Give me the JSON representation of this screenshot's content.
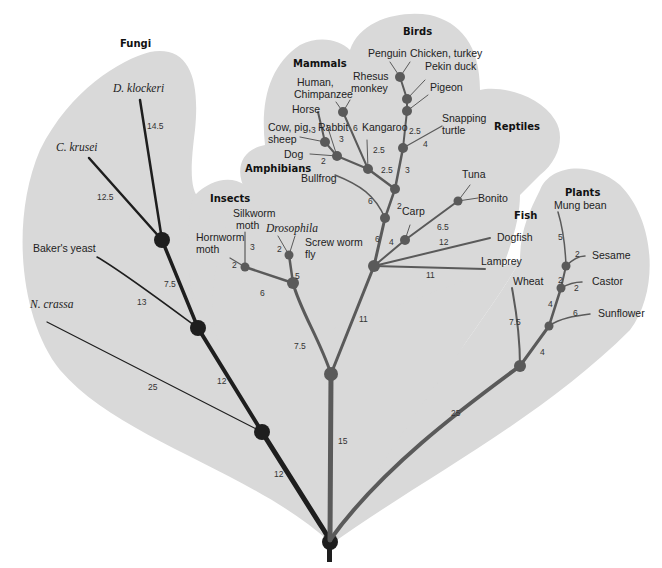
{
  "groups": [
    {
      "id": "fungi",
      "label": "Fungi"
    },
    {
      "id": "insects",
      "label": "Insects"
    },
    {
      "id": "amphibians",
      "label": "Amphibians"
    },
    {
      "id": "mammals",
      "label": "Mammals"
    },
    {
      "id": "birds",
      "label": "Birds"
    },
    {
      "id": "reptiles",
      "label": "Reptiles"
    },
    {
      "id": "fish",
      "label": "Fish"
    },
    {
      "id": "plants",
      "label": "Plants"
    }
  ],
  "species": {
    "d_klockeri": "D. klockeri",
    "c_krusei": "C. krusei",
    "bakers_yeast": "Baker's yeast",
    "n_crassa": "N. crassa",
    "hornworm_1": "Hornworm",
    "hornworm_2": "moth",
    "silkworm_1": "Silkworm",
    "silkworm_2": "moth",
    "drosophila": "Drosophila",
    "screwworm_1": "Screw worm",
    "screwworm_2": "fly",
    "human_1": "Human,",
    "human_2": "Chimpanzee",
    "rhesus_1": "Rhesus",
    "rhesus_2": "monkey",
    "horse": "Horse",
    "cow_1": "Cow, pig,",
    "cow_2": "sheep",
    "rabbit": "Rabbit",
    "kangaroo": "Kangaroo",
    "dog": "Dog",
    "bullfrog": "Bullfrog",
    "penguin": "Penguin",
    "chicken": "Chicken, turkey",
    "pekin_duck": "Pekin duck",
    "pigeon": "Pigeon",
    "snapping_1": "Snapping",
    "snapping_2": "turtle",
    "tuna": "Tuna",
    "bonito": "Bonito",
    "carp": "Carp",
    "dogfish": "Dogfish",
    "lamprey": "Lamprey",
    "wheat": "Wheat",
    "mung_bean": "Mung bean",
    "sesame": "Sesame",
    "castor": "Castor",
    "sunflower": "Sunflower"
  },
  "distances": {
    "d_klockeri": "14.5",
    "c_krusei": "12.5",
    "fungi_inner": "7.5",
    "bakers_yeast": "13",
    "n_crassa": "25",
    "fungi_stem_upper": "12",
    "fungi_stem_lower": "12",
    "hornworm": "2",
    "silkworm": "3",
    "moth_stem": "6",
    "drosophila": "2",
    "screwworm_stem": "5",
    "insect_stem": "7.5",
    "animal_upper": "11",
    "animal_trunk": "15",
    "cow": "3",
    "rabbit": "3",
    "horse_dog": "2",
    "kangaroo_a": "6",
    "kangaroo_b": "2.5",
    "placental_stem": "2.5",
    "bird_stem_a": "2.5",
    "bird_stem_b": "3",
    "snapping": "4",
    "bullfrog": "6",
    "carp_a": "2",
    "carp_b": "4",
    "vert_stem": "6",
    "tuna_stem": "6.5",
    "dogfish": "12",
    "lamprey": "11",
    "mung_bean": "5",
    "sesame": "2",
    "castor_a": "2",
    "castor_b": "2",
    "plant_mid": "4",
    "sunflower": "6",
    "wheat": "7.5",
    "plant_lower": "4",
    "plant_stem": "25"
  }
}
